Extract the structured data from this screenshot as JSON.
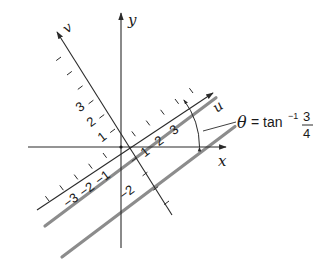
{
  "figure": {
    "axes": {
      "x_label": "x",
      "y_label": "y",
      "u_label": "u",
      "v_label": "v"
    },
    "u_ticks": [
      {
        "value": 1,
        "label": "1"
      },
      {
        "value": 2,
        "label": "2"
      },
      {
        "value": 3,
        "label": "3"
      },
      {
        "value": -1,
        "label": "−1"
      },
      {
        "value": -2,
        "label": "−2"
      },
      {
        "value": -3,
        "label": "−3"
      }
    ],
    "v_ticks": [
      {
        "value": 1,
        "label": "1"
      },
      {
        "value": 2,
        "label": "2"
      },
      {
        "value": 3,
        "label": "3"
      },
      {
        "value": -2,
        "label": "−2"
      }
    ],
    "angle_annotation": {
      "theta": "θ",
      "equals": "=",
      "func": "tan",
      "exponent": "−1",
      "numerator": "3",
      "denominator": "4"
    },
    "parallel_lines": [
      {
        "name": "line-near",
        "description": "thick gray line parallel to u-axis"
      },
      {
        "name": "line-far",
        "description": "thick gray line parallel to u-axis"
      }
    ],
    "colors": {
      "axis": "#2a2a2a",
      "parallel_line": "#8c8c8c",
      "background": "#ffffff"
    }
  }
}
